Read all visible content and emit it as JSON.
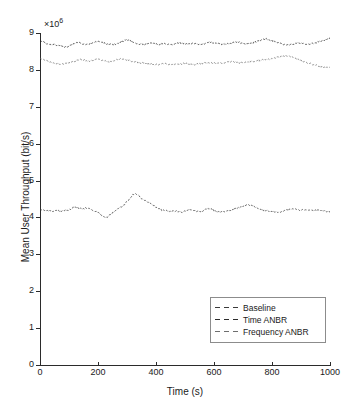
{
  "chart_data": {
    "type": "line",
    "title": "",
    "xlabel": "Time (s)",
    "ylabel": "Mean User Throughput (bit/s)",
    "y_multiplier_label": "×10",
    "y_multiplier_exponent": "6",
    "xlim": [
      0,
      1000
    ],
    "ylim": [
      0,
      9000000
    ],
    "xticks": [
      0,
      200,
      400,
      600,
      800,
      1000
    ],
    "xticklabels": [
      "0",
      "200",
      "400",
      "600",
      "800",
      "1000"
    ],
    "yticks": [
      0,
      1000000,
      2000000,
      3000000,
      4000000,
      5000000,
      6000000,
      7000000,
      8000000,
      9000000
    ],
    "yticklabels": [
      "0",
      "1",
      "2",
      "3",
      "4",
      "5",
      "6",
      "7",
      "8",
      "9"
    ],
    "grid": false,
    "legend_position": "lower-right",
    "legend_entries": [
      "Baseline",
      "Time ANBR",
      "Frequency ANBR"
    ],
    "x": [
      0,
      10,
      20,
      30,
      40,
      50,
      60,
      70,
      80,
      90,
      100,
      110,
      120,
      130,
      140,
      150,
      160,
      170,
      180,
      190,
      200,
      210,
      220,
      230,
      240,
      250,
      260,
      270,
      280,
      290,
      300,
      310,
      320,
      330,
      340,
      350,
      360,
      370,
      380,
      390,
      400,
      410,
      420,
      430,
      440,
      450,
      460,
      470,
      480,
      490,
      500,
      510,
      520,
      530,
      540,
      550,
      560,
      570,
      580,
      590,
      600,
      610,
      620,
      630,
      640,
      650,
      660,
      670,
      680,
      690,
      700,
      710,
      720,
      730,
      740,
      750,
      760,
      770,
      780,
      790,
      800,
      810,
      820,
      830,
      840,
      850,
      860,
      870,
      880,
      890,
      900,
      910,
      920,
      930,
      940,
      950,
      960,
      970,
      980,
      990,
      1000
    ],
    "series": [
      {
        "name": "Baseline",
        "style": "dashed",
        "color": "#3a3a3a",
        "mean": 4200000,
        "values": [
          4200000,
          4190000,
          4170000,
          4180000,
          4160000,
          4175000,
          4185000,
          4165000,
          4180000,
          4195000,
          4210000,
          4250000,
          4290000,
          4270000,
          4240000,
          4230000,
          4260000,
          4240000,
          4200000,
          4170000,
          4140000,
          4080000,
          4010000,
          4000000,
          4060000,
          4120000,
          4180000,
          4230000,
          4290000,
          4350000,
          4430000,
          4520000,
          4620000,
          4650000,
          4590000,
          4520000,
          4470000,
          4420000,
          4380000,
          4330000,
          4280000,
          4230000,
          4200000,
          4190000,
          4170000,
          4160000,
          4180000,
          4170000,
          4160000,
          4150000,
          4170000,
          4200000,
          4220000,
          4190000,
          4170000,
          4160000,
          4180000,
          4210000,
          4240000,
          4220000,
          4190000,
          4170000,
          4160000,
          4150000,
          4170000,
          4190000,
          4210000,
          4230000,
          4260000,
          4280000,
          4300000,
          4320000,
          4340000,
          4330000,
          4290000,
          4250000,
          4220000,
          4200000,
          4180000,
          4170000,
          4160000,
          4150000,
          4140000,
          4160000,
          4180000,
          4200000,
          4220000,
          4240000,
          4230000,
          4210000,
          4200000,
          4210000,
          4220000,
          4200000,
          4180000,
          4190000,
          4200000,
          4190000,
          4170000,
          4160000,
          4150000
        ]
      },
      {
        "name": "Time ANBR",
        "style": "dashed",
        "color": "#2b2b2b",
        "mean": 8700000,
        "values": [
          8790000,
          8760000,
          8720000,
          8700000,
          8690000,
          8680000,
          8670000,
          8650000,
          8630000,
          8620000,
          8640000,
          8680000,
          8720000,
          8750000,
          8730000,
          8700000,
          8690000,
          8710000,
          8740000,
          8760000,
          8780000,
          8760000,
          8730000,
          8700000,
          8690000,
          8680000,
          8700000,
          8730000,
          8760000,
          8790000,
          8810000,
          8790000,
          8760000,
          8730000,
          8710000,
          8700000,
          8690000,
          8710000,
          8730000,
          8720000,
          8700000,
          8690000,
          8700000,
          8710000,
          8700000,
          8690000,
          8700000,
          8720000,
          8740000,
          8730000,
          8710000,
          8700000,
          8710000,
          8720000,
          8700000,
          8690000,
          8700000,
          8720000,
          8740000,
          8750000,
          8730000,
          8710000,
          8700000,
          8690000,
          8700000,
          8710000,
          8720000,
          8740000,
          8760000,
          8740000,
          8720000,
          8700000,
          8710000,
          8730000,
          8750000,
          8780000,
          8800000,
          8820000,
          8840000,
          8820000,
          8790000,
          8760000,
          8740000,
          8720000,
          8700000,
          8690000,
          8680000,
          8690000,
          8710000,
          8730000,
          8720000,
          8700000,
          8690000,
          8700000,
          8720000,
          8740000,
          8760000,
          8780000,
          8800000,
          8830000,
          8860000
        ]
      },
      {
        "name": "Frequency ANBR",
        "style": "dashed",
        "color": "#6e6e6e",
        "mean": 8200000,
        "values": [
          8310000,
          8280000,
          8250000,
          8220000,
          8200000,
          8180000,
          8170000,
          8160000,
          8170000,
          8180000,
          8190000,
          8210000,
          8240000,
          8270000,
          8290000,
          8270000,
          8250000,
          8240000,
          8260000,
          8280000,
          8290000,
          8270000,
          8250000,
          8230000,
          8220000,
          8240000,
          8260000,
          8280000,
          8300000,
          8290000,
          8270000,
          8250000,
          8230000,
          8210000,
          8200000,
          8190000,
          8180000,
          8170000,
          8160000,
          8150000,
          8140000,
          8150000,
          8160000,
          8170000,
          8160000,
          8150000,
          8140000,
          8150000,
          8160000,
          8170000,
          8180000,
          8170000,
          8160000,
          8150000,
          8160000,
          8170000,
          8180000,
          8190000,
          8200000,
          8190000,
          8180000,
          8170000,
          8180000,
          8190000,
          8200000,
          8210000,
          8220000,
          8210000,
          8200000,
          8190000,
          8200000,
          8210000,
          8220000,
          8230000,
          8240000,
          8250000,
          8260000,
          8270000,
          8280000,
          8290000,
          8300000,
          8320000,
          8340000,
          8360000,
          8380000,
          8390000,
          8370000,
          8340000,
          8310000,
          8280000,
          8250000,
          8220000,
          8190000,
          8170000,
          8150000,
          8130000,
          8110000,
          8090000,
          8070000,
          8060000,
          8080000
        ]
      }
    ]
  },
  "axes": {
    "exp_prefix": "×10"
  }
}
